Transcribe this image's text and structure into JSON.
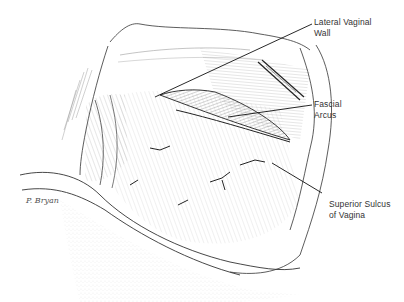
{
  "figure": {
    "type": "anatomical line illustration",
    "background": "#ffffff",
    "ink_color": "#222222",
    "labels": [
      {
        "id": "lateral-vaginal-wall",
        "line1": "Lateral Vaginal",
        "line2": "Wall",
        "leader_from": [
          155,
          97
        ],
        "leader_to": [
          312,
          24
        ]
      },
      {
        "id": "fascial-arcus",
        "line1": "Fascial",
        "line2": "Arcus",
        "leader_from": [
          228,
          117
        ],
        "leader_to": [
          312,
          105
        ]
      },
      {
        "id": "superior-sulcus",
        "line1": "Superior Sulcus",
        "line2": "of Vagina",
        "leader_from": [
          272,
          163
        ],
        "leader_to": [
          322,
          193
        ]
      }
    ],
    "signature": "P. Bryan"
  }
}
